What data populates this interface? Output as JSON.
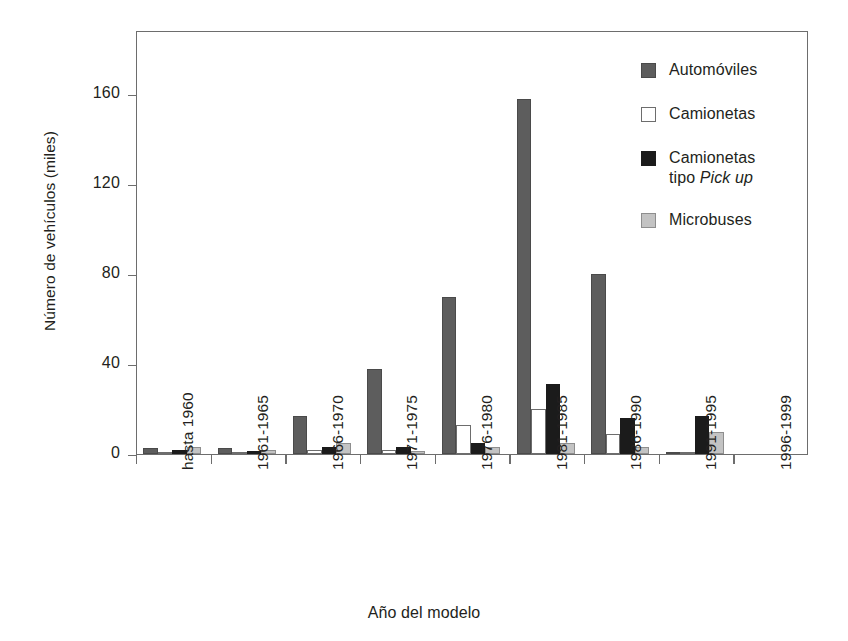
{
  "chart_data": {
    "type": "bar",
    "title": "",
    "subtitle": "",
    "xlabel": "Año del modelo",
    "ylabel": "Número de vehículos (miles)",
    "categories": [
      "hasta 1960",
      "1961-1965",
      "1966-1970",
      "1971-1975",
      "1976-1980",
      "1981-1985",
      "1986-1990",
      "1991-1995",
      "1996-1999"
    ],
    "yticks": [
      0,
      40,
      80,
      120,
      160
    ],
    "ylim": [
      0,
      188
    ],
    "grid": false,
    "legend_position": "top-right-outside",
    "orientation": "vertical",
    "grouping": "grouped",
    "series": [
      {
        "name": "Automóviles",
        "color": "#5d5d5d",
        "values": [
          2.5,
          2.5,
          17,
          38,
          70,
          158,
          80,
          0.5,
          0
        ]
      },
      {
        "name": "Camionetas",
        "color": "#ffffff",
        "values": [
          0.8,
          0.8,
          2,
          2,
          13,
          20,
          9,
          0.3,
          0
        ]
      },
      {
        "name": "Camionetas tipo Pick up",
        "name_plain": "Camionetas",
        "name_italic_part": "tipo Pick up",
        "color": "#1b1b1b",
        "values": [
          2,
          1.2,
          3,
          3,
          5,
          31,
          16,
          17,
          0
        ]
      },
      {
        "name": "Microbuses",
        "color": "#c3c3c3",
        "values": [
          3,
          2,
          5,
          1.5,
          3,
          5,
          3,
          10,
          0
        ]
      }
    ]
  },
  "legend": {
    "items": [
      {
        "label": "Automóviles",
        "label2": "",
        "italic2": ""
      },
      {
        "label": "Camionetas",
        "label2": "",
        "italic2": ""
      },
      {
        "label": "Camionetas",
        "label2": "tipo ",
        "italic2": "Pick up"
      },
      {
        "label": "Microbuses",
        "label2": "",
        "italic2": ""
      }
    ]
  },
  "axes": {
    "y_label": "Número de vehículos (miles)",
    "x_label": "Año del modelo",
    "y_tick_labels": [
      "0",
      "40",
      "80",
      "120",
      "160"
    ],
    "x_tick_labels": [
      "hasta 1960",
      "1961-1965",
      "1966-1970",
      "1971-1975",
      "1976-1980",
      "1981-1985",
      "1986-1990",
      "1991-1995",
      "1996-1999"
    ]
  },
  "colors": {
    "series_automoviles": "#5d5d5d",
    "series_camionetas": "#ffffff",
    "series_pickup": "#1b1b1b",
    "series_microbuses": "#c3c3c3",
    "axis": "#6d6d6d",
    "text": "#231f20",
    "background": "#ffffff"
  }
}
